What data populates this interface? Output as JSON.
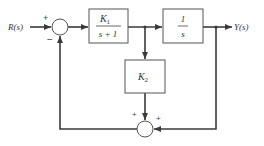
{
  "diagram": {
    "input_label": "R(s)",
    "output_label": "Y(s)",
    "blocks": [
      {
        "id": "k1",
        "numerator": "K",
        "numerator_sub": "1",
        "denominator": "s + 1"
      },
      {
        "id": "integrator",
        "numerator": "1",
        "denominator": "s"
      },
      {
        "id": "k2",
        "label": "K",
        "label_sub": "2"
      }
    ],
    "summers": [
      {
        "id": "sum1",
        "signs": {
          "top_left": "+",
          "bottom_left": "−"
        }
      },
      {
        "id": "sum2",
        "signs": {
          "top_left": "+",
          "top_right": "+"
        }
      }
    ],
    "colors": {
      "line": "#3a3a3a",
      "text": "#333333",
      "background": "#ffffff"
    }
  }
}
